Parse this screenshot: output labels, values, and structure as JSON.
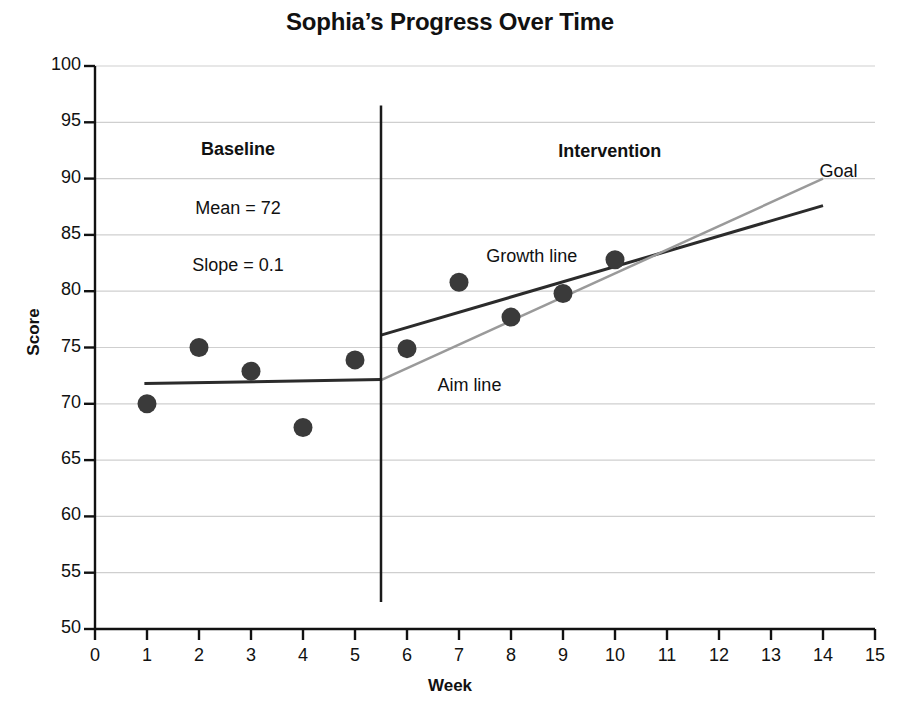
{
  "chart_data": {
    "type": "scatter",
    "title": "Sophia’s Progress Over Time",
    "xlabel": "Week",
    "ylabel": "Score",
    "xlim": [
      0,
      15
    ],
    "ylim": [
      50,
      100
    ],
    "xticks": [
      0,
      1,
      2,
      3,
      4,
      5,
      6,
      7,
      8,
      9,
      10,
      11,
      12,
      13,
      14,
      15
    ],
    "yticks": [
      50,
      55,
      60,
      65,
      70,
      75,
      80,
      85,
      90,
      95,
      100
    ],
    "grid": "horizontal",
    "legend": "none",
    "series": [
      {
        "name": "Baseline scores",
        "marker": "filled-circle",
        "color": "#3a3a3a",
        "points": [
          {
            "x": 1,
            "y": 70.0
          },
          {
            "x": 2,
            "y": 75.0
          },
          {
            "x": 3,
            "y": 72.9
          },
          {
            "x": 4,
            "y": 67.9
          },
          {
            "x": 5,
            "y": 73.9
          }
        ]
      },
      {
        "name": "Intervention scores",
        "marker": "filled-circle",
        "color": "#3a3a3a",
        "points": [
          {
            "x": 6,
            "y": 74.9
          },
          {
            "x": 7,
            "y": 80.8
          },
          {
            "x": 8,
            "y": 77.7
          },
          {
            "x": 9,
            "y": 79.8
          },
          {
            "x": 10,
            "y": 82.8
          }
        ]
      }
    ],
    "lines": [
      {
        "name": "Baseline trend line",
        "color": "#2b2b2b",
        "width": 3,
        "x1": 0.95,
        "y1": 71.8,
        "x2": 5.5,
        "y2": 72.15
      },
      {
        "name": "Growth line",
        "color": "#2b2b2b",
        "width": 3,
        "x1": 5.5,
        "y1": 76.1,
        "x2": 14.0,
        "y2": 87.6
      },
      {
        "name": "Aim line",
        "color": "#9a9a9a",
        "width": 2.5,
        "x1": 5.5,
        "y1": 72.1,
        "x2": 14.0,
        "y2": 90.0
      },
      {
        "name": "Phase change line",
        "color": "#1a1a1a",
        "width": 2.5,
        "x1": 5.5,
        "y1": 96.5,
        "x2": 5.5,
        "y2": 52.4
      }
    ],
    "annotations": [
      {
        "name": "baseline-phase-label",
        "text": "Baseline",
        "bold": true,
        "x": 2.75,
        "y": 92.5
      },
      {
        "name": "baseline-mean-label",
        "text": "Mean = 72",
        "bold": false,
        "x": 2.75,
        "y": 87.3
      },
      {
        "name": "baseline-slope-label",
        "text": "Slope = 0.1",
        "bold": false,
        "x": 2.75,
        "y": 82.2
      },
      {
        "name": "intervention-phase-label",
        "text": "Intervention",
        "bold": true,
        "x": 9.9,
        "y": 92.4
      },
      {
        "name": "goal-label",
        "text": "Goal",
        "bold": false,
        "x": 14.3,
        "y": 90.6
      },
      {
        "name": "growth-line-label",
        "text": "Growth line",
        "bold": false,
        "x": 8.4,
        "y": 83.0
      },
      {
        "name": "aim-line-label",
        "text": "Aim line",
        "bold": false,
        "x": 7.2,
        "y": 71.6
      }
    ]
  }
}
